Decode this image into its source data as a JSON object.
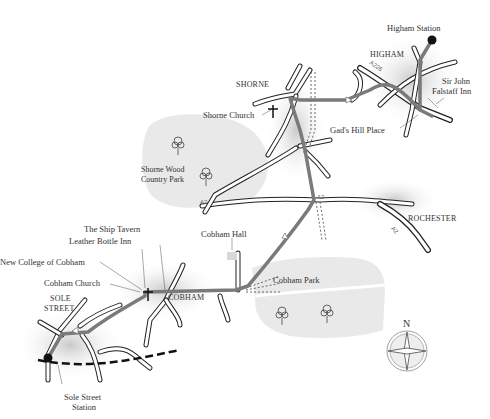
{
  "map": {
    "places": {
      "higham_station": "Higham Station",
      "higham": "HIGHAM",
      "sir_john_falstaff_line1": "Sir John",
      "sir_john_falstaff_line2": "Falstaff Inn",
      "gads_hill_place": "Gad's Hill Place",
      "shorne": "SHORNE",
      "shorne_church": "Shorne Church",
      "shorne_wood_line1": "Shorne Wood",
      "shorne_wood_line2": "Country Park",
      "rochester": "ROCHESTER",
      "cobham_hall": "Cobham Hall",
      "cobham_park": "Cobham Park",
      "the_ship_tavern": "The Ship Tavern",
      "leather_bottle_inn": "Leather Bottle Inn",
      "new_college_of_cobham": "New College of Cobham",
      "cobham_church": "Cobham Church",
      "cobham": "COBHAM",
      "sole_street_line1": "SOLE",
      "sole_street_line2": "STREET",
      "sole_street_station_line1": "Sole Street",
      "sole_street_station_line2": "Station"
    },
    "roads": {
      "a226": "A226",
      "a2_west": "A2",
      "a2_junction": "A2",
      "a2_rochester": "A2"
    },
    "compass": {
      "north_label": "N"
    },
    "colors": {
      "route": "#7a7a7a",
      "road_outline": "#222222",
      "road_fill": "#ffffff",
      "park_fill": "#e8e8e8",
      "railway": "#111111",
      "shadow": "#bdbdbd"
    }
  }
}
